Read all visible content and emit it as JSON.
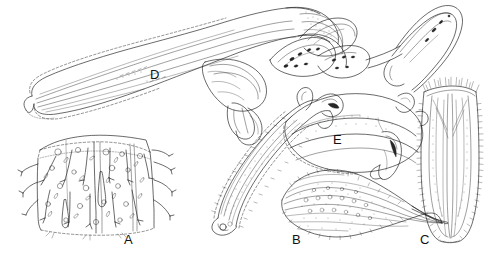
{
  "figure": {
    "type": "scientific-illustration-plate",
    "medium": "ink line drawing",
    "background_color": "#ffffff",
    "ink_color": "#1a1a1a",
    "width": 503,
    "height": 256,
    "caption_labels_style": "plain capital letters, sans-serif"
  },
  "panels": [
    {
      "id": "A",
      "label": "A",
      "label_x": 128,
      "label_y": 240,
      "subject": "cuticle block with setae, pores and scattered sensilla",
      "description": "rectangular three-dimensional cuticular fragment drawn in perspective with dashed hidden edges, covered in branched setae, oval pores and small circular alveoli"
    },
    {
      "id": "B",
      "label": "B",
      "label_x": 297,
      "label_y": 240,
      "subject": "lanceolate leaf-shaped appendage",
      "description": "ovate-lanceolate blade with longitudinal striations, marginal fringe of short spines, internal rows of circular pores and a tapering pointed apex to the right"
    },
    {
      "id": "C",
      "label": "C",
      "label_x": 425,
      "label_y": 240,
      "subject": "elongate tubular organ with marginal fringe",
      "description": "narrow elongate structure with rounded base, longitudinal internal strands and dense lateral fringes of fine hairs along both margins"
    },
    {
      "id": "D",
      "label": "D",
      "label_x": 155,
      "label_y": 75,
      "subject": "elongate curved appendage with basal articulation",
      "description": "long tapering curved structure with dashed outline margin, longitudinal internal lines, swollen articulated base at right connecting to lobed plates"
    },
    {
      "id": "E",
      "label": "E",
      "label_x": 338,
      "label_y": 140,
      "subject": "curved elongate appendage with fringed margin and hooked apex",
      "description": "slender sigmoid structure with dense stippled surface, dashed fringed margin, bulbous base at lower left and a hooked sclerotised tip at upper right"
    }
  ],
  "label_list": [
    "A",
    "B",
    "C",
    "D",
    "E"
  ]
}
